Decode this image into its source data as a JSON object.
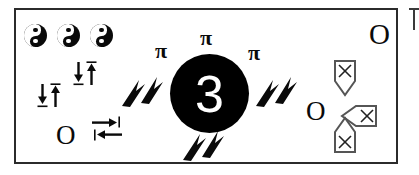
{
  "diagram": {
    "background_color": "#ffffff",
    "frame_color": "#2b2b2b",
    "ink_color": "#0a0a0a",
    "marker_stroke_color": "#555555",
    "center": {
      "label": "3",
      "fill_color": "#000000",
      "text_color": "#ffffff"
    },
    "yin_yang_row": {
      "count": 3,
      "symbol_name": "yin-yang",
      "label": "☯"
    },
    "pi_symbols": [
      {
        "label": "π",
        "position": "left"
      },
      {
        "label": "π",
        "position": "top"
      },
      {
        "label": "π",
        "position": "right"
      }
    ],
    "arrow_pairs": [
      {
        "label": "↓↑",
        "position": "lower-left"
      },
      {
        "label": "↓↑",
        "position": "mid-left"
      }
    ],
    "converge_arrows": {
      "label": "→←",
      "position": "left-center"
    },
    "letters_o": [
      {
        "label": "O",
        "position": "bottom-left"
      },
      {
        "label": "O",
        "position": "right-center"
      },
      {
        "label": "O",
        "position": "top-right"
      }
    ],
    "lightning_bolts": [
      {
        "label": "⚡",
        "position": "left-of-center"
      },
      {
        "label": "⚡",
        "position": "right-of-center"
      },
      {
        "label": "⚡",
        "position": "below-center"
      }
    ],
    "x_markers": [
      {
        "label": "✕",
        "direction": "down",
        "shape": "shield"
      },
      {
        "label": "✕",
        "direction": "left",
        "shape": "pennant"
      },
      {
        "label": "✕",
        "direction": "up",
        "shape": "house"
      }
    ]
  }
}
